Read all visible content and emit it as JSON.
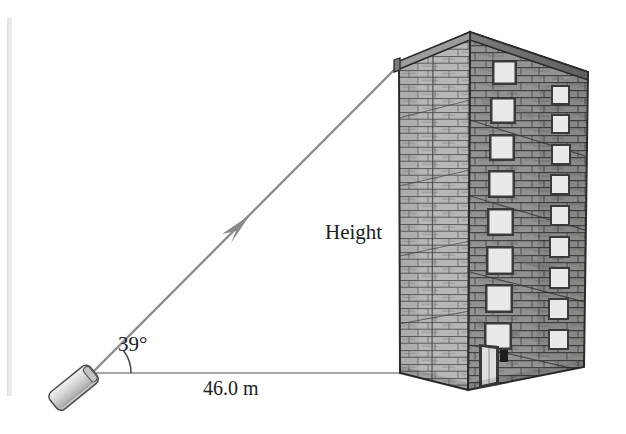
{
  "figure": {
    "type": "geometry-diagram",
    "background_color": "#ffffff",
    "labels": {
      "angle": "39°",
      "distance": "46.0 m",
      "height": "Height"
    },
    "colors": {
      "line": "#8a8a8a",
      "ink": "#20201f",
      "building_left_face": "#b5b5b3",
      "building_right_face": "#8e8e8c",
      "building_outline": "#2b2b2a",
      "roof_band": "#6d6d6b",
      "window_pane": "#e8e8e6",
      "window_frame": "#3a3a38",
      "device_body": "#d2d2d0",
      "margin_bar": "#ececeb"
    },
    "geometry": {
      "vertex": [
        95,
        373
      ],
      "baseline_end": [
        400,
        373
      ],
      "sightline_end": [
        400,
        64
      ],
      "angle_degrees": 39,
      "arc_radius": 34,
      "arrow_position": [
        236,
        229
      ]
    },
    "elements": {
      "margin_bar": "left-margin-rule",
      "device": "laser-rangefinder",
      "sightline": "line-of-sight-arrow",
      "baseline": "ground-distance-line",
      "angle_arc": "elevation-angle-arc",
      "building": "stone-apartment-building"
    },
    "building": {
      "stories": 10,
      "window_columns": 2,
      "left_column_windows": 9,
      "right_column_windows": 10,
      "door": "entrance-door",
      "apex": [
        470,
        32
      ],
      "left_top": [
        399,
        63
      ],
      "right_top": [
        588,
        72
      ],
      "left_bottom": [
        400,
        373
      ],
      "near_bottom": [
        468,
        390
      ],
      "right_bottom": [
        584,
        367
      ]
    }
  }
}
